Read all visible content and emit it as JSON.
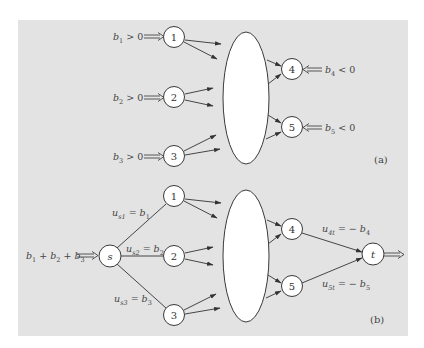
{
  "figure": {
    "background_color": "#e3e3e3",
    "node_fill": "#ffffff",
    "stroke_color": "#3a3a3a"
  },
  "panel_a": {
    "tag": "(a)",
    "nodes": [
      {
        "id": "1",
        "label": "1"
      },
      {
        "id": "2",
        "label": "2"
      },
      {
        "id": "3",
        "label": "3"
      },
      {
        "id": "4",
        "label": "4"
      },
      {
        "id": "5",
        "label": "5"
      }
    ],
    "supply_labels": [
      {
        "var": "b",
        "sub": "1",
        "rel": " > 0"
      },
      {
        "var": "b",
        "sub": "2",
        "rel": " > 0"
      },
      {
        "var": "b",
        "sub": "3",
        "rel": " > 0"
      }
    ],
    "demand_labels": [
      {
        "var": "b",
        "sub": "4",
        "rel": " < 0"
      },
      {
        "var": "b",
        "sub": "5",
        "rel": " < 0"
      }
    ]
  },
  "panel_b": {
    "tag": "(b)",
    "source": {
      "label": "s"
    },
    "sink": {
      "label": "t"
    },
    "nodes": [
      {
        "id": "1",
        "label": "1"
      },
      {
        "id": "2",
        "label": "2"
      },
      {
        "id": "3",
        "label": "3"
      },
      {
        "id": "4",
        "label": "4"
      },
      {
        "id": "5",
        "label": "5"
      }
    ],
    "source_supply": {
      "b1": "b",
      "s1": "1",
      "plus1": " + ",
      "b2": "b",
      "s2": "2",
      "plus2": " + ",
      "b3": "b",
      "s3": "3"
    },
    "arc_labels": {
      "us1": {
        "u": "u",
        "sub": "s1",
        "eq": " = ",
        "b": "b",
        "bsub": "1"
      },
      "us2": {
        "u": "u",
        "sub": "s2",
        "eq": " = ",
        "b": "b",
        "bsub": "2"
      },
      "us3": {
        "u": "u",
        "sub": "s3",
        "eq": " = ",
        "b": "b",
        "bsub": "3"
      },
      "u4t": {
        "u": "u",
        "sub": "4t",
        "eq": " = − ",
        "b": "b",
        "bsub": "4"
      },
      "u5t": {
        "u": "u",
        "sub": "5t",
        "eq": " = − ",
        "b": "b",
        "bsub": "5"
      }
    }
  }
}
